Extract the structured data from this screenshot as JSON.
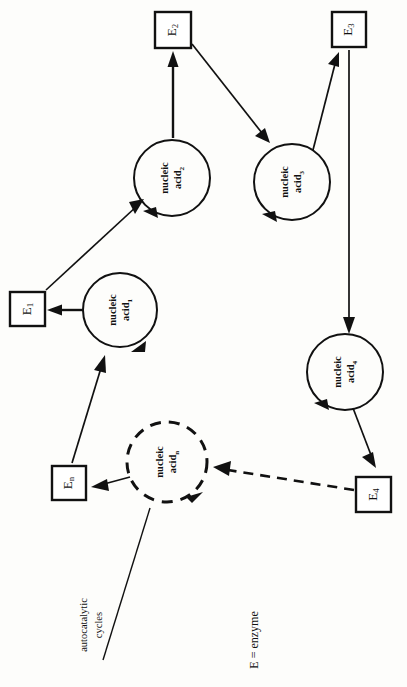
{
  "figure": {
    "orientation": "rotated-90-ccw",
    "background_color": "#fdfdfb",
    "ink_color": "#111111"
  },
  "nodes": {
    "cycles": [
      {
        "id": "na1",
        "base": "nucleic",
        "line2": "acid",
        "subscript": "1",
        "style": "solid",
        "cx": 120,
        "cy": 310,
        "r": 37
      },
      {
        "id": "na2",
        "base": "nucleic",
        "line2": "acid",
        "subscript": "2",
        "style": "solid",
        "cx": 172,
        "cy": 178,
        "r": 38
      },
      {
        "id": "na3",
        "base": "nucleic",
        "line2": "acid",
        "subscript": "3",
        "style": "solid",
        "cx": 292,
        "cy": 182,
        "r": 38
      },
      {
        "id": "na4",
        "base": "nucleic",
        "line2": "acid",
        "subscript": "4",
        "style": "solid",
        "cx": 345,
        "cy": 372,
        "r": 38
      },
      {
        "id": "nan",
        "base": "nucleic",
        "line2": "acid",
        "subscript": "n",
        "style": "dashed",
        "cx": 167,
        "cy": 462,
        "r": 40
      }
    ],
    "enzymes": [
      {
        "id": "e1",
        "base": "E",
        "subscript": "1",
        "x": 10,
        "y": 292,
        "w": 35,
        "h": 34
      },
      {
        "id": "e2",
        "base": "E",
        "subscript": "2",
        "x": 155,
        "y": 12,
        "w": 36,
        "h": 36
      },
      {
        "id": "e3",
        "base": "E",
        "subscript": "3",
        "x": 332,
        "y": 12,
        "w": 34,
        "h": 35
      },
      {
        "id": "e4",
        "base": "E",
        "subscript": "4",
        "x": 356,
        "y": 477,
        "w": 35,
        "h": 35
      },
      {
        "id": "en",
        "base": "E",
        "subscript": "n",
        "x": 52,
        "y": 466,
        "w": 34,
        "h": 34
      }
    ]
  },
  "annotations": {
    "autocatalytic_label": {
      "line1": "autocatalytic",
      "line2": "cycles",
      "x": 92,
      "y": 625
    },
    "legend": {
      "text": "E  =  enzyme",
      "x": 255,
      "y": 640
    }
  },
  "edges": [
    {
      "id": "na1-to-e1",
      "from": "na1",
      "to": "e1",
      "style": "solid",
      "label": ""
    },
    {
      "id": "e1-to-na2",
      "from": "e1",
      "to": "na2",
      "style": "solid",
      "label": ""
    },
    {
      "id": "na2-to-e2",
      "from": "na2",
      "to": "e2",
      "style": "solid",
      "label": ""
    },
    {
      "id": "e2-to-na3",
      "from": "e2",
      "to": "na3",
      "style": "solid",
      "label": ""
    },
    {
      "id": "na3-to-e3",
      "from": "na3",
      "to": "e3",
      "style": "solid",
      "label": ""
    },
    {
      "id": "e3-to-na4",
      "from": "e3",
      "to": "na4",
      "style": "solid",
      "label": ""
    },
    {
      "id": "na4-to-e4",
      "from": "na4",
      "to": "e4",
      "style": "solid",
      "label": ""
    },
    {
      "id": "e4-to-nan",
      "from": "e4",
      "to": "nan",
      "style": "dashed",
      "label": ""
    },
    {
      "id": "nan-to-en",
      "from": "nan",
      "to": "en",
      "style": "solid",
      "label": ""
    },
    {
      "id": "en-to-na1",
      "from": "en",
      "to": "na1",
      "style": "solid",
      "label": ""
    }
  ]
}
